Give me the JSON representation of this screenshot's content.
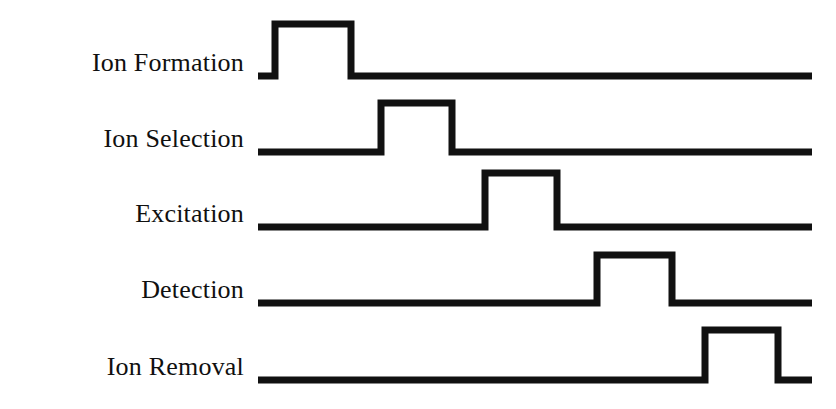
{
  "figure": {
    "kind": "timing-diagram",
    "background_color": "#ffffff",
    "line_color": "#111111",
    "text_color": "#101010",
    "canvas": {
      "width": 836,
      "height": 409
    }
  },
  "rows": [
    {
      "label": "Ion Formation",
      "label_y": 63,
      "baseline_y": 76,
      "top_y": 24,
      "start_x": 258,
      "rise_x": 275,
      "fall_x": 351,
      "end_x": 812
    },
    {
      "label": "Ion Selection",
      "label_y": 139,
      "baseline_y": 152,
      "top_y": 103,
      "start_x": 258,
      "rise_x": 381,
      "fall_x": 452,
      "end_x": 812
    },
    {
      "label": "Excitation",
      "label_y": 214,
      "baseline_y": 227,
      "top_y": 173,
      "start_x": 258,
      "rise_x": 485,
      "fall_x": 557,
      "end_x": 812
    },
    {
      "label": "Detection",
      "label_y": 290,
      "baseline_y": 303,
      "top_y": 255,
      "start_x": 258,
      "rise_x": 597,
      "fall_x": 672,
      "end_x": 812
    },
    {
      "label": "Ion Removal",
      "label_y": 367,
      "baseline_y": 380,
      "top_y": 330,
      "start_x": 258,
      "rise_x": 705,
      "fall_x": 778,
      "end_x": 812
    }
  ],
  "chart_data": {
    "type": "line",
    "title": "",
    "xlabel": "",
    "ylabel": "",
    "grid": false,
    "legend": null,
    "categories": [
      "Ion Formation",
      "Ion Selection",
      "Excitation",
      "Detection",
      "Ion Removal"
    ],
    "series": [
      {
        "name": "Ion Formation",
        "pulse_start": 275,
        "pulse_end": 351,
        "state_sequence": [
          0,
          1,
          0
        ]
      },
      {
        "name": "Ion Selection",
        "pulse_start": 381,
        "pulse_end": 452,
        "state_sequence": [
          0,
          1,
          0
        ]
      },
      {
        "name": "Excitation",
        "pulse_start": 485,
        "pulse_end": 557,
        "state_sequence": [
          0,
          1,
          0
        ]
      },
      {
        "name": "Detection",
        "pulse_start": 597,
        "pulse_end": 672,
        "state_sequence": [
          0,
          1,
          0
        ]
      },
      {
        "name": "Ion Removal",
        "pulse_start": 705,
        "pulse_end": 778,
        "state_sequence": [
          0,
          1,
          0
        ]
      }
    ]
  }
}
